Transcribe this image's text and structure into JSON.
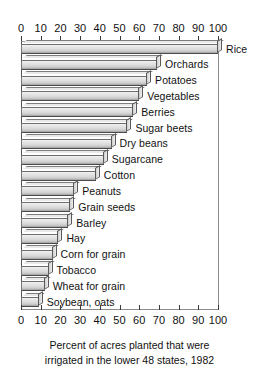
{
  "chart_data": {
    "type": "bar",
    "orientation": "horizontal",
    "title": "",
    "xlabel": "Percent of acres planted that were irrigated in the lower 48 states, 1982",
    "ylabel": "",
    "xlim": [
      0,
      100
    ],
    "xticks": [
      0,
      10,
      20,
      30,
      40,
      50,
      60,
      70,
      80,
      90,
      100
    ],
    "xtick_labels": [
      "0",
      "10",
      "20",
      "30",
      "40",
      "50",
      "60",
      "70",
      "80",
      "90",
      "100"
    ],
    "grid": false,
    "legend": "none",
    "axis_positions": [
      "top",
      "bottom"
    ],
    "categories": [
      "Rice",
      "Orchards",
      "Potatoes",
      "Vegetables",
      "Berries",
      "Sugar beets",
      "Dry beans",
      "Sugarcane",
      "Cotton",
      "Peanuts",
      "Grain seeds",
      "Barley",
      "Hay",
      "Corn for grain",
      "Tobacco",
      "Wheat for grain",
      "Soybean, oats"
    ],
    "values": [
      100,
      69,
      64,
      60,
      57,
      54,
      46,
      42,
      38,
      27,
      25,
      24,
      19,
      16,
      14,
      12,
      9
    ],
    "bars": [
      {
        "label": "Rice",
        "value": 100
      },
      {
        "label": "Orchards",
        "value": 69
      },
      {
        "label": "Potatoes",
        "value": 64
      },
      {
        "label": "Vegetables",
        "value": 60
      },
      {
        "label": "Berries",
        "value": 57
      },
      {
        "label": "Sugar beets",
        "value": 54
      },
      {
        "label": "Dry beans",
        "value": 46
      },
      {
        "label": "Sugarcane",
        "value": 42
      },
      {
        "label": "Cotton",
        "value": 38
      },
      {
        "label": "Peanuts",
        "value": 27
      },
      {
        "label": "Grain seeds",
        "value": 25
      },
      {
        "label": "Barley",
        "value": 24
      },
      {
        "label": "Hay",
        "value": 19
      },
      {
        "label": "Corn for grain",
        "value": 16
      },
      {
        "label": "Tobacco",
        "value": 14
      },
      {
        "label": "Wheat for grain",
        "value": 12
      },
      {
        "label": "Soybean, oats",
        "value": 9
      }
    ],
    "colors": {
      "bar_face": "#e0e0e0",
      "bar_edge": "#4a4a4a",
      "axis": "#555555",
      "text": "#111111",
      "background": "#ffffff"
    }
  },
  "caption": {
    "line1": "Percent of acres planted that were",
    "line2": "irrigated in the lower 48 states, 1982"
  }
}
